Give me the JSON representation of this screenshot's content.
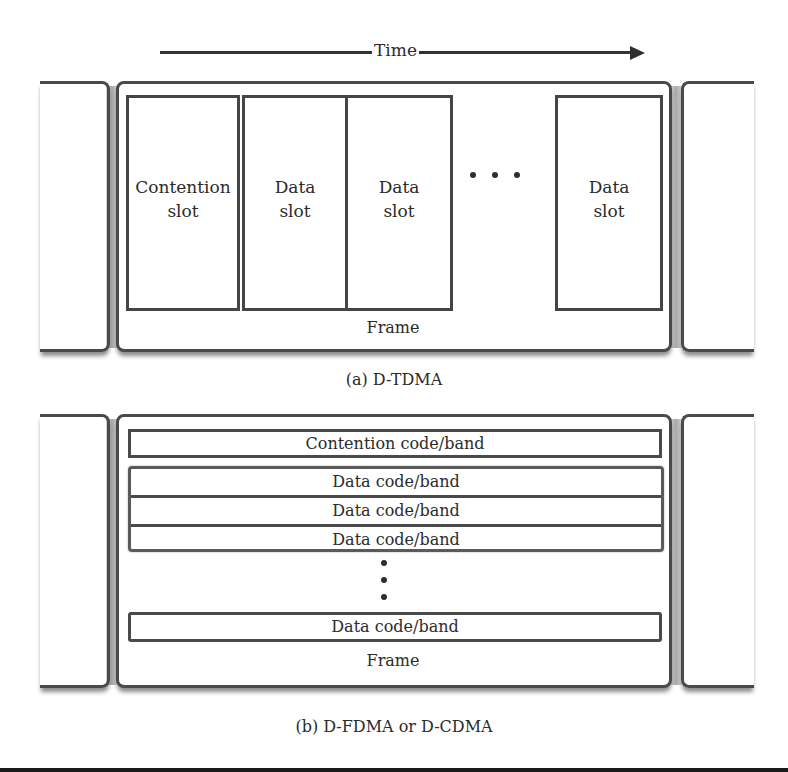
{
  "figure": {
    "time_axis": {
      "label": "Time",
      "direction": "left-to-right-arrow"
    },
    "panel_a": {
      "caption": "(a) D-TDMA",
      "frame_label": "Frame",
      "slots": [
        {
          "line1": "Contention",
          "line2": "slot"
        },
        {
          "line1": "Data",
          "line2": "slot"
        },
        {
          "line1": "Data",
          "line2": "slot"
        },
        {
          "line1": "Data",
          "line2": "slot"
        }
      ],
      "ellipsis": "horizontal-dots-icon"
    },
    "panel_b": {
      "caption": "(b) D-FDMA or D-CDMA",
      "frame_label": "Frame",
      "contention_band": "Contention code/band",
      "data_bands": [
        "Data code/band",
        "Data code/band",
        "Data code/band"
      ],
      "last_data_band": "Data code/band",
      "ellipsis": "vertical-dots-icon"
    }
  }
}
